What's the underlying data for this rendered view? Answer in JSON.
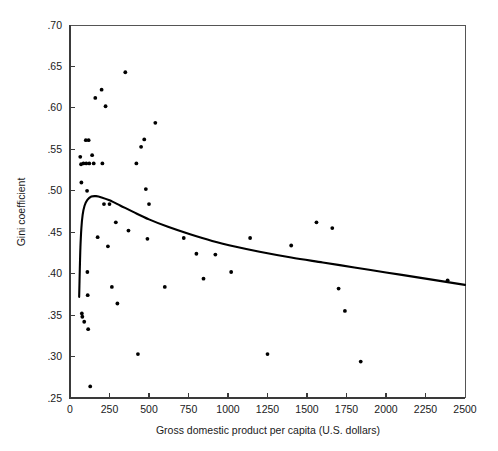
{
  "chart_data": {
    "type": "scatter",
    "title": "",
    "subtitle": "",
    "xlabel": "Gross domestic product per capita (U.S. dollars)",
    "ylabel": "Gini coefficient",
    "xlim": [
      0,
      2500
    ],
    "ylim": [
      0.25,
      0.7
    ],
    "xticks": [
      0,
      250,
      500,
      750,
      1000,
      1250,
      1500,
      1750,
      2000,
      2250,
      2500
    ],
    "xticklabels": [
      "0",
      "250",
      "500",
      "750",
      "1000",
      "1250",
      "1500",
      "1750",
      "2000",
      "2250",
      "2500"
    ],
    "yticks": [
      0.25,
      0.3,
      0.35,
      0.4,
      0.45,
      0.5,
      0.55,
      0.6,
      0.65,
      0.7
    ],
    "yticklabels": [
      ".25",
      ".30",
      ".35",
      ".40",
      ".45",
      ".50",
      ".55",
      ".60",
      ".65",
      ".70"
    ],
    "grid": false,
    "legend": null,
    "annotations": [],
    "marker_color": "#000000",
    "curve_color": "#000000",
    "frame_color": "#555555",
    "points": [
      {
        "x": 65,
        "y": 0.541
      },
      {
        "x": 70,
        "y": 0.532
      },
      {
        "x": 72,
        "y": 0.51
      },
      {
        "x": 75,
        "y": 0.352
      },
      {
        "x": 78,
        "y": 0.348
      },
      {
        "x": 85,
        "y": 0.533
      },
      {
        "x": 90,
        "y": 0.342
      },
      {
        "x": 100,
        "y": 0.561
      },
      {
        "x": 103,
        "y": 0.533
      },
      {
        "x": 108,
        "y": 0.5
      },
      {
        "x": 110,
        "y": 0.402
      },
      {
        "x": 112,
        "y": 0.374
      },
      {
        "x": 115,
        "y": 0.333
      },
      {
        "x": 118,
        "y": 0.561
      },
      {
        "x": 122,
        "y": 0.533
      },
      {
        "x": 128,
        "y": 0.264
      },
      {
        "x": 140,
        "y": 0.543
      },
      {
        "x": 150,
        "y": 0.533
      },
      {
        "x": 160,
        "y": 0.612
      },
      {
        "x": 175,
        "y": 0.444
      },
      {
        "x": 200,
        "y": 0.622
      },
      {
        "x": 205,
        "y": 0.533
      },
      {
        "x": 215,
        "y": 0.484
      },
      {
        "x": 225,
        "y": 0.602
      },
      {
        "x": 240,
        "y": 0.433
      },
      {
        "x": 250,
        "y": 0.484
      },
      {
        "x": 265,
        "y": 0.384
      },
      {
        "x": 290,
        "y": 0.462
      },
      {
        "x": 300,
        "y": 0.364
      },
      {
        "x": 350,
        "y": 0.643
      },
      {
        "x": 370,
        "y": 0.452
      },
      {
        "x": 420,
        "y": 0.533
      },
      {
        "x": 430,
        "y": 0.303
      },
      {
        "x": 450,
        "y": 0.553
      },
      {
        "x": 470,
        "y": 0.562
      },
      {
        "x": 480,
        "y": 0.502
      },
      {
        "x": 490,
        "y": 0.442
      },
      {
        "x": 500,
        "y": 0.484
      },
      {
        "x": 540,
        "y": 0.582
      },
      {
        "x": 600,
        "y": 0.384
      },
      {
        "x": 720,
        "y": 0.443
      },
      {
        "x": 800,
        "y": 0.424
      },
      {
        "x": 845,
        "y": 0.394
      },
      {
        "x": 920,
        "y": 0.423
      },
      {
        "x": 1020,
        "y": 0.402
      },
      {
        "x": 1140,
        "y": 0.443
      },
      {
        "x": 1250,
        "y": 0.303
      },
      {
        "x": 1400,
        "y": 0.434
      },
      {
        "x": 1560,
        "y": 0.462
      },
      {
        "x": 1660,
        "y": 0.455
      },
      {
        "x": 1700,
        "y": 0.382
      },
      {
        "x": 1740,
        "y": 0.355
      },
      {
        "x": 1840,
        "y": 0.294
      },
      {
        "x": 2390,
        "y": 0.392
      }
    ],
    "fit_curve": [
      {
        "x": 58,
        "y": 0.372
      },
      {
        "x": 62,
        "y": 0.405
      },
      {
        "x": 66,
        "y": 0.432
      },
      {
        "x": 72,
        "y": 0.455
      },
      {
        "x": 80,
        "y": 0.471
      },
      {
        "x": 92,
        "y": 0.482
      },
      {
        "x": 110,
        "y": 0.489
      },
      {
        "x": 135,
        "y": 0.493
      },
      {
        "x": 165,
        "y": 0.4935
      },
      {
        "x": 200,
        "y": 0.492
      },
      {
        "x": 250,
        "y": 0.4885
      },
      {
        "x": 320,
        "y": 0.482
      },
      {
        "x": 400,
        "y": 0.4745
      },
      {
        "x": 500,
        "y": 0.4655
      },
      {
        "x": 620,
        "y": 0.4565
      },
      {
        "x": 760,
        "y": 0.4475
      },
      {
        "x": 900,
        "y": 0.4395
      },
      {
        "x": 1050,
        "y": 0.4325
      },
      {
        "x": 1200,
        "y": 0.4265
      },
      {
        "x": 1400,
        "y": 0.4195
      },
      {
        "x": 1600,
        "y": 0.4135
      },
      {
        "x": 1800,
        "y": 0.4075
      },
      {
        "x": 2000,
        "y": 0.4015
      },
      {
        "x": 2200,
        "y": 0.3955
      },
      {
        "x": 2400,
        "y": 0.3895
      },
      {
        "x": 2500,
        "y": 0.3865
      }
    ]
  }
}
